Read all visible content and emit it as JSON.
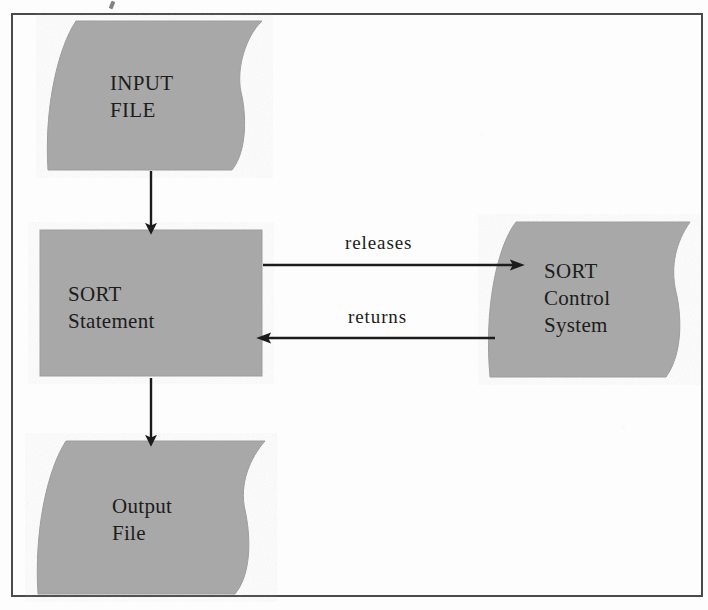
{
  "diagram": {
    "colors": {
      "node_fill": "#a8a8a8",
      "node_edge": "#9a9a9a",
      "line": "#1c1c1c",
      "frame": "#4a4a4a",
      "background": "#fdfdfd",
      "text": "#1c1c1c"
    },
    "nodes": [
      {
        "id": "input-file",
        "label": "INPUT\nFILE",
        "shape": "tape",
        "x": 48,
        "y": 21,
        "width": 214,
        "height": 149
      },
      {
        "id": "sort-statement",
        "label": "SORT\nStatement",
        "shape": "rectangle",
        "x": 40,
        "y": 230,
        "width": 222,
        "height": 146
      },
      {
        "id": "sort-control-system",
        "label": "SORT\nControl\nSystem",
        "shape": "tape",
        "x": 488,
        "y": 222,
        "width": 202,
        "height": 155
      },
      {
        "id": "output-file",
        "label": "Output\nFile",
        "shape": "tape",
        "x": 38,
        "y": 441,
        "width": 227,
        "height": 153
      }
    ],
    "edges": [
      {
        "id": "input-to-sort",
        "label": "",
        "from": "input-file",
        "to": "sort-statement",
        "direction": "down"
      },
      {
        "id": "sort-to-control",
        "label": "releases",
        "from": "sort-statement",
        "to": "sort-control-system",
        "direction": "right"
      },
      {
        "id": "control-to-sort",
        "label": "returns",
        "from": "sort-control-system",
        "to": "sort-statement",
        "direction": "left"
      },
      {
        "id": "sort-to-output",
        "label": "",
        "from": "sort-statement",
        "to": "output-file",
        "direction": "down"
      }
    ]
  }
}
